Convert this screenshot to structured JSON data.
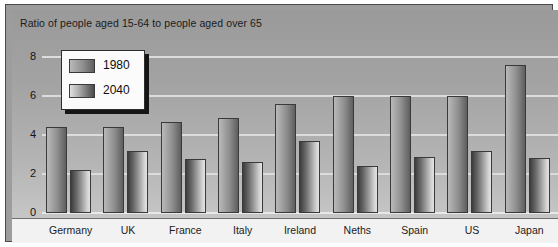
{
  "chart_data": {
    "type": "bar",
    "title": "Ratio of people aged 15-64 to people aged over 65",
    "xlabel": "",
    "ylabel": "",
    "ylim": [
      0,
      9
    ],
    "yticks": [
      0,
      2,
      4,
      6,
      8
    ],
    "ytick_labels": [
      "0",
      "2",
      "4",
      "6",
      "8"
    ],
    "grid": true,
    "legend_position": "upper-left-inside",
    "categories": [
      "Germany",
      "UK",
      "France",
      "Italy",
      "Ireland",
      "Neths",
      "Spain",
      "US",
      "Japan"
    ],
    "series": [
      {
        "name": "1980",
        "color": "#8e8e8e",
        "values": [
          4.4,
          4.4,
          4.7,
          4.9,
          5.6,
          6.0,
          6.0,
          6.0,
          7.6
        ]
      },
      {
        "name": "2040",
        "color": "#9a9a9a",
        "values": [
          2.2,
          3.2,
          2.8,
          2.6,
          3.7,
          2.4,
          2.9,
          3.2,
          2.85
        ]
      }
    ]
  },
  "legend": {
    "entries": [
      {
        "label": "1980"
      },
      {
        "label": "2040"
      }
    ]
  },
  "colors": {
    "panel_background": "#a3a3a3",
    "gridline": "#dcdcdc",
    "axis_strip": "#f2f2f2",
    "frame": "#4a4a4a",
    "text": "#1b1b1b"
  }
}
